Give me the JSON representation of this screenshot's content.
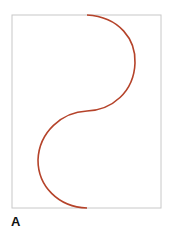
{
  "figure": {
    "panel_label": "A",
    "frame": {
      "x": 12,
      "y": 15,
      "width": 149,
      "height": 193,
      "stroke": "#c8c8c8"
    },
    "curve": {
      "description": "S-shaped curve made of two semicircular arcs",
      "color": "#b5432a",
      "start": [
        87,
        15
      ],
      "middle": [
        87,
        111
      ],
      "end": [
        87,
        208
      ]
    }
  }
}
